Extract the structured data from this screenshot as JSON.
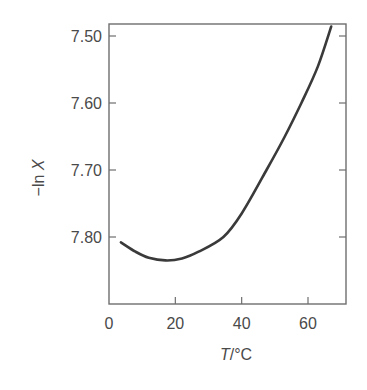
{
  "chart_data": {
    "type": "line",
    "title": "",
    "xlabel": "T/°C",
    "xlabel_italic": "T",
    "xlabel_unit": "/°C",
    "ylabel": "−ln X",
    "ylabel_prefix": "−ln ",
    "ylabel_italic": "X",
    "xlim": [
      0,
      72
    ],
    "ylim": [
      7.5,
      7.9
    ],
    "y_inverted": true,
    "grid": false,
    "legend": null,
    "x_ticks": [
      0,
      20,
      40,
      60
    ],
    "x_tick_labels": [
      "0",
      "20",
      "40",
      "60"
    ],
    "y_ticks": [
      7.5,
      7.6,
      7.7,
      7.8
    ],
    "y_tick_labels": [
      "7.50",
      "7.60",
      "7.70",
      "7.80"
    ],
    "series": [
      {
        "name": "-ln X vs T",
        "x": [
          3.6,
          8,
          12,
          17,
          22,
          27,
          34.5,
          40,
          47.5,
          53,
          58,
          63,
          67
        ],
        "y": [
          7.808,
          7.822,
          7.831,
          7.835,
          7.832,
          7.822,
          7.8,
          7.765,
          7.7,
          7.65,
          7.6,
          7.545,
          7.486
        ]
      }
    ]
  },
  "colors": {
    "axis": "#6e6e6e",
    "curve": "#3a3a3a",
    "text": "#4a4a4a"
  }
}
